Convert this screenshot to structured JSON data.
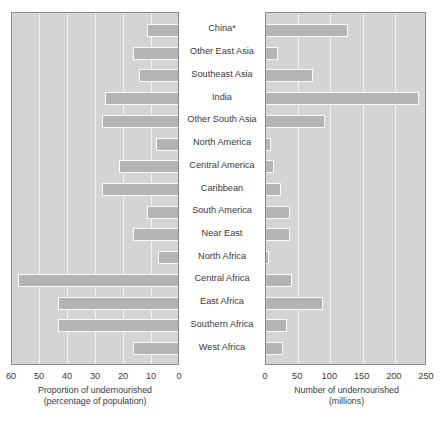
{
  "chart_data": {
    "type": "bar",
    "orientation": "horizontal",
    "layout": "back-to-back pyramid (two mirrored panels sharing centred category labels)",
    "grid": true,
    "legend": null,
    "categories": [
      "China*",
      "Other East Asia",
      "Southeast Asia",
      "India",
      "Other South Asia",
      "North America",
      "Central America",
      "Caribbean",
      "South America",
      "Near East",
      "North Africa",
      "Central Africa",
      "East Africa",
      "Southern Africa",
      "West Africa"
    ],
    "series": [
      {
        "name": "Proportion of undernourished (percentage of population)",
        "panel": "left",
        "direction": "right-to-left",
        "unit": "%",
        "xlim": [
          0,
          60
        ],
        "ticks": [
          60,
          50,
          40,
          30,
          20,
          10,
          0
        ],
        "xlabel": "Proportion of undernourished (percentage of population)",
        "values": [
          11,
          16,
          14,
          26,
          27,
          8,
          21,
          27,
          11,
          16,
          7,
          57,
          43,
          43,
          16
        ]
      },
      {
        "name": "Number of undernourished (millions)",
        "panel": "right",
        "direction": "left-to-right",
        "unit": "millions",
        "xlim": [
          0,
          250
        ],
        "ticks": [
          0,
          50,
          100,
          150,
          200,
          250
        ],
        "xlabel": "Number of undernourished (millions)",
        "values": [
          128,
          19,
          73,
          238,
          92,
          8,
          12,
          24,
          38,
          38,
          5,
          40,
          88,
          32,
          26
        ]
      }
    ],
    "axis_titles": {
      "left_line1": "Proportion of undernourished",
      "left_line2": "(percentage of population)",
      "right_line1": "Number of undernourished",
      "right_line2": "(millions)"
    },
    "colors": {
      "panel_background": "#d4d4d4",
      "bar_fill": "#b4b4b4",
      "bar_outline": "#fafafa",
      "gridline": "#f2f2f2",
      "frame": "#8c8c8c",
      "text": "#3a3a3a",
      "page_background": "#ffffff"
    }
  }
}
